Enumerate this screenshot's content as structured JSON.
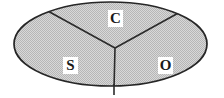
{
  "diagram": {
    "type": "partitioned-ellipse",
    "shape": {
      "name": "ellipse",
      "center_x": 110.5,
      "center_y": 44,
      "radius_x": 96.5,
      "radius_y": 42,
      "fill_color": "#c9c9c9",
      "fill_pattern": "halftone-checker",
      "stroke_color": "#262626",
      "stroke_width": 1.6
    },
    "center_point": {
      "x": 115,
      "y": 48
    },
    "dividers": [
      {
        "name": "divider-upper-left",
        "from_x": 115,
        "from_y": 48,
        "to_x": 50,
        "to_y": 12
      },
      {
        "name": "divider-upper-right",
        "from_x": 115,
        "from_y": 48,
        "to_x": 178,
        "to_y": 14
      },
      {
        "name": "divider-lower",
        "from_x": 115,
        "from_y": 48,
        "to_x": 114,
        "to_y": 95
      }
    ],
    "divider_color": "#2b2b2b",
    "regions": [
      {
        "id": "c",
        "label": "C",
        "position": "top",
        "label_x": 108,
        "label_y": 10
      },
      {
        "id": "s",
        "label": "S",
        "position": "bottom-left",
        "label_x": 63,
        "label_y": 57
      },
      {
        "id": "o",
        "label": "O",
        "position": "bottom-right",
        "label_x": 158,
        "label_y": 57
      }
    ],
    "label_box_color": "#ffffff",
    "label_text_color": "#1a1a1a",
    "background_color": "#ffffff"
  }
}
